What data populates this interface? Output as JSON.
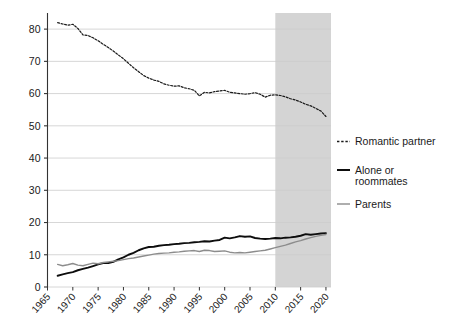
{
  "chart_data": {
    "type": "line",
    "title": "",
    "subtitle": "",
    "xlabel": "",
    "ylabel": "",
    "xlim": [
      1965,
      2021
    ],
    "ylim": [
      0,
      85
    ],
    "yticks": [
      0,
      10,
      20,
      30,
      40,
      50,
      60,
      70,
      80
    ],
    "xticks": [
      1965,
      1970,
      1975,
      1980,
      1985,
      1990,
      1995,
      2000,
      2005,
      2010,
      2015,
      2020
    ],
    "grid": "horizontal",
    "legend_position": "right",
    "shaded_region": {
      "from": 2010,
      "to": 2021,
      "color": "#d4d4d4"
    },
    "colors": {
      "romantic_partner": "#1a1a1a",
      "alone_or_roommates": "#0d0d0d",
      "parents": "#8c8c8c",
      "gridline": "#cccccc",
      "axis": "#333333",
      "shade": "#d4d4d4"
    },
    "series": [
      {
        "name": "Romantic partner",
        "style": "dashed",
        "color": "#1a1a1a",
        "x": [
          1967,
          1968,
          1969,
          1970,
          1971,
          1972,
          1973,
          1974,
          1975,
          1976,
          1977,
          1978,
          1979,
          1980,
          1981,
          1982,
          1983,
          1984,
          1985,
          1986,
          1987,
          1988,
          1989,
          1990,
          1991,
          1992,
          1993,
          1994,
          1995,
          1996,
          1997,
          1998,
          1999,
          2000,
          2001,
          2002,
          2003,
          2004,
          2005,
          2006,
          2007,
          2008,
          2009,
          2010,
          2011,
          2012,
          2013,
          2014,
          2015,
          2016,
          2017,
          2018,
          2019,
          2020
        ],
        "values": [
          82.0,
          81.6,
          81.2,
          81.5,
          80.2,
          78.2,
          78.0,
          77.3,
          76.4,
          75.3,
          74.3,
          73.2,
          72.0,
          70.8,
          69.4,
          68.0,
          66.8,
          65.6,
          64.8,
          64.2,
          63.8,
          63.0,
          62.6,
          62.3,
          62.4,
          61.8,
          61.5,
          61.0,
          59.3,
          60.4,
          60.2,
          60.6,
          60.8,
          61.0,
          60.4,
          60.2,
          60.0,
          59.8,
          60.0,
          60.3,
          59.8,
          58.9,
          59.5,
          59.6,
          59.4,
          59.0,
          58.4,
          58.0,
          57.4,
          56.7,
          56.2,
          55.4,
          54.6,
          52.9
        ]
      },
      {
        "name": "Alone or roommates",
        "style": "solid",
        "color": "#0d0d0d",
        "x": [
          1967,
          1968,
          1969,
          1970,
          1971,
          1972,
          1973,
          1974,
          1975,
          1976,
          1977,
          1978,
          1979,
          1980,
          1981,
          1982,
          1983,
          1984,
          1985,
          1986,
          1987,
          1988,
          1989,
          1990,
          1991,
          1992,
          1993,
          1994,
          1995,
          1996,
          1997,
          1998,
          1999,
          2000,
          2001,
          2002,
          2003,
          2004,
          2005,
          2006,
          2007,
          2008,
          2009,
          2010,
          2011,
          2012,
          2013,
          2014,
          2015,
          2016,
          2017,
          2018,
          2019,
          2020
        ],
        "values": [
          3.5,
          3.9,
          4.3,
          4.6,
          5.2,
          5.6,
          6.0,
          6.5,
          7.0,
          7.4,
          7.4,
          7.8,
          8.6,
          9.2,
          10.0,
          10.6,
          11.4,
          12.0,
          12.4,
          12.5,
          12.8,
          13.0,
          13.1,
          13.3,
          13.4,
          13.6,
          13.7,
          13.9,
          14.0,
          14.2,
          14.1,
          14.4,
          14.6,
          15.3,
          15.1,
          15.4,
          15.8,
          15.6,
          15.7,
          15.2,
          15.0,
          14.9,
          15.0,
          15.2,
          15.1,
          15.3,
          15.4,
          15.6,
          15.9,
          16.4,
          16.2,
          16.4,
          16.6,
          16.7
        ]
      },
      {
        "name": "Parents",
        "style": "solid",
        "color": "#8c8c8c",
        "x": [
          1967,
          1968,
          1969,
          1970,
          1971,
          1972,
          1973,
          1974,
          1975,
          1976,
          1977,
          1978,
          1979,
          1980,
          1981,
          1982,
          1983,
          1984,
          1985,
          1986,
          1987,
          1988,
          1989,
          1990,
          1991,
          1992,
          1993,
          1994,
          1995,
          1996,
          1997,
          1998,
          1999,
          2000,
          2001,
          2002,
          2003,
          2004,
          2005,
          2006,
          2007,
          2008,
          2009,
          2010,
          2011,
          2012,
          2013,
          2014,
          2015,
          2016,
          2017,
          2018,
          2019,
          2020
        ],
        "values": [
          7.0,
          6.6,
          6.9,
          7.3,
          6.8,
          6.6,
          7.0,
          7.4,
          7.2,
          7.6,
          7.8,
          8.0,
          8.2,
          8.5,
          8.8,
          9.0,
          9.3,
          9.6,
          9.9,
          10.2,
          10.4,
          10.5,
          10.6,
          10.8,
          10.9,
          11.1,
          11.2,
          11.3,
          11.0,
          11.4,
          11.3,
          11.0,
          11.1,
          11.2,
          10.8,
          10.6,
          10.7,
          10.6,
          10.8,
          11.0,
          11.2,
          11.4,
          11.8,
          12.2,
          12.6,
          13.0,
          13.5,
          14.0,
          14.4,
          14.9,
          15.3,
          15.7,
          16.0,
          16.3
        ]
      }
    ],
    "legend": [
      {
        "label": "Romantic partner",
        "style": "dashed",
        "color": "#1a1a1a"
      },
      {
        "label": "Alone or roommates",
        "style": "solid",
        "color": "#0d0d0d"
      },
      {
        "label": "Parents",
        "style": "solid",
        "color": "#8c8c8c"
      }
    ],
    "ytick_labels": [
      "0",
      "10",
      "20",
      "30",
      "40",
      "50",
      "60",
      "70",
      "80"
    ],
    "xtick_labels": [
      "1965",
      "1970",
      "1975",
      "1980",
      "1985",
      "1990",
      "1995",
      "2000",
      "2005",
      "2010",
      "2015",
      "2020"
    ]
  }
}
